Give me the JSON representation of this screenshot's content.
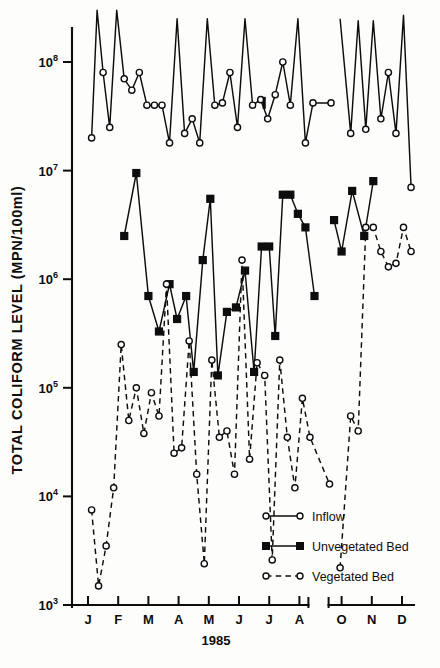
{
  "figure": {
    "background_color": "#fdfdfb",
    "ink_color": "#0d0d0d"
  },
  "axes": {
    "y_title": "TOTAL COLIFORM LEVEL (MPN/100ml)",
    "x_title": "1985",
    "y_tick_labels": [
      "10",
      "10",
      "10",
      "10",
      "10",
      "10"
    ],
    "y_tick_exponents": [
      "8",
      "7",
      "6",
      "5",
      "4",
      "3"
    ],
    "x_tick_labels": [
      "J",
      "F",
      "M",
      "A",
      "M",
      "J",
      "J",
      "A",
      "O",
      "N",
      "D"
    ],
    "axis_break_note": "break between A and O"
  },
  "legend": {
    "items": [
      {
        "label": "Inflow",
        "marker": "open-circle",
        "line": "solid"
      },
      {
        "label": "Unvegetated Bed",
        "marker": "filled-square",
        "line": "solid"
      },
      {
        "label": "Vegetated Bed",
        "marker": "open-circle",
        "line": "dashed"
      }
    ]
  },
  "chart_data": {
    "type": "line",
    "title": "",
    "xlabel": "1985",
    "ylabel": "TOTAL COLIFORM LEVEL (MPN/100ml)",
    "y_scale": "log",
    "ylim": [
      1000,
      300000000
    ],
    "y_ticks": [
      1000,
      10000,
      100000,
      1000000,
      10000000,
      100000000
    ],
    "x_categories": [
      "J",
      "F",
      "M",
      "A",
      "M",
      "J",
      "J",
      "A",
      "O",
      "N",
      "D"
    ],
    "x_axis_break_between": [
      "A",
      "O"
    ],
    "grid": false,
    "legend_position": "inside-lower-right",
    "series": [
      {
        "name": "Inflow",
        "marker": "open-circle",
        "linestyle": "solid",
        "x": [
          0.12,
          0.3,
          0.5,
          0.72,
          0.95,
          1.2,
          1.45,
          1.7,
          1.95,
          2.2,
          2.45,
          2.7,
          2.95,
          3.2,
          3.45,
          3.7,
          3.95,
          4.2,
          4.45,
          4.7,
          4.95,
          5.2,
          5.45,
          5.72,
          5.95,
          6.2,
          6.45,
          6.7,
          6.95,
          7.2,
          7.45,
          7.65,
          7.95,
          8.3,
          8.55,
          8.8,
          9.05,
          9.3,
          9.55,
          9.8,
          10.05,
          10.3
        ],
        "y": [
          20000000,
          300000000,
          80000000,
          25000000,
          300000000,
          70000000,
          55000000,
          80000000,
          40000000,
          40000000,
          40000000,
          18000000,
          250000000,
          22000000,
          30000000,
          18000000,
          250000000,
          40000000,
          42000000,
          80000000,
          25000000,
          250000000,
          40000000,
          45000000,
          30000000,
          50000000,
          100000000,
          40000000,
          250000000,
          18000000,
          42000000,
          42000000,
          250000000,
          22000000,
          240000000,
          24000000,
          240000000,
          30000000,
          80000000,
          22000000,
          270000000,
          7000000
        ]
      },
      {
        "name": "Unvegetated Bed",
        "marker": "filled-square",
        "linestyle": "solid",
        "x": [
          1.2,
          1.6,
          2.0,
          2.35,
          2.7,
          2.95,
          3.25,
          3.5,
          3.8,
          4.05,
          4.3,
          4.6,
          4.9,
          5.2,
          5.5,
          5.75,
          6.0,
          6.2,
          6.45,
          6.7,
          6.95,
          7.2,
          7.5,
          7.75,
          8.0,
          8.35,
          8.75,
          9.05
        ],
        "y": [
          2500000,
          9500000,
          700000,
          330000,
          900000,
          430000,
          700000,
          140000,
          1500000,
          5500000,
          130000,
          500000,
          550000,
          1200000,
          140000,
          2000000,
          2000000,
          300000,
          6000000,
          6000000,
          4000000,
          3000000,
          700000,
          3500000,
          1800000,
          6500000,
          2500000,
          8000000
        ]
      },
      {
        "name": "Vegetated Bed",
        "marker": "open-circle",
        "linestyle": "dashed",
        "x": [
          0.12,
          0.35,
          0.6,
          0.85,
          1.1,
          1.35,
          1.6,
          1.85,
          2.1,
          2.35,
          2.6,
          2.85,
          3.1,
          3.35,
          3.6,
          3.85,
          4.1,
          4.35,
          4.6,
          4.85,
          5.1,
          5.35,
          5.6,
          5.85,
          6.1,
          6.35,
          6.6,
          6.85,
          7.1,
          7.35,
          7.6,
          7.95,
          8.3,
          8.55,
          8.8,
          9.05,
          9.3,
          9.55,
          9.8,
          10.05,
          10.3
        ],
        "y": [
          7500,
          1500,
          3500,
          12000,
          250000,
          50000,
          100000,
          38000,
          90000,
          55000,
          900000,
          25000,
          28000,
          270000,
          16000,
          2400,
          180000,
          35000,
          40000,
          16000,
          1500000,
          22000,
          170000,
          130000,
          2600,
          180000,
          35000,
          12000,
          80000,
          35000,
          13000,
          2200,
          55000,
          40000,
          3000000,
          3000000,
          1800000,
          1300000,
          1400000,
          3000000,
          1800000
        ]
      }
    ]
  }
}
